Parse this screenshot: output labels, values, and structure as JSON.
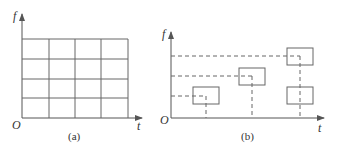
{
  "panels": [
    {
      "id": "a",
      "caption": "(a)",
      "y_axis_label": "f",
      "x_axis_label": "t",
      "origin_label": "O",
      "description": "Uniform time-frequency tiling grid, 4 columns x 4 rows"
    },
    {
      "id": "b",
      "caption": "(b)",
      "y_axis_label": "f",
      "x_axis_label": "t",
      "origin_label": "O",
      "description": "Time-frequency atoms (boxes) at different time-frequency centers with dashed projection lines"
    }
  ],
  "colors": {
    "line": "#666666",
    "axis": "#555555",
    "text": "#333333",
    "background": "#ffffff"
  }
}
